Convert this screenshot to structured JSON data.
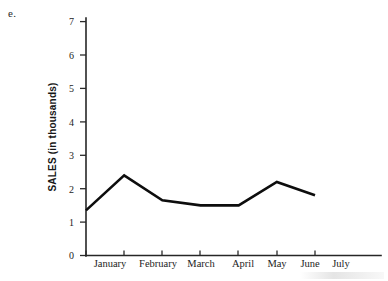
{
  "figure": {
    "part_label": "e.",
    "background_color": "#ffffff",
    "ink_color": "#0d0d0d"
  },
  "chart_data": {
    "type": "line",
    "title": "",
    "xlabel": "",
    "ylabel": "SALES (in thousands)",
    "categories": [
      "January",
      "February",
      "March",
      "April",
      "May",
      "June",
      "July"
    ],
    "values": [
      1.35,
      2.4,
      1.65,
      1.5,
      1.5,
      2.2,
      1.8
    ],
    "series": [
      {
        "name": "Sales",
        "values": [
          1.35,
          2.4,
          1.65,
          1.5,
          1.5,
          2.2,
          1.8
        ]
      }
    ],
    "ylim": [
      0,
      7
    ],
    "ytick_labels": [
      "0",
      "1",
      "2",
      "3",
      "4",
      "5",
      "6",
      "7"
    ],
    "ytick_values": [
      0,
      1,
      2,
      3,
      4,
      5,
      6,
      7
    ],
    "xtick_labels": [
      "January",
      "February",
      "March",
      "April",
      "May",
      "June",
      "July"
    ],
    "grid": false,
    "legend": "none",
    "marker": "none",
    "line_color": "#0d0d0d"
  }
}
